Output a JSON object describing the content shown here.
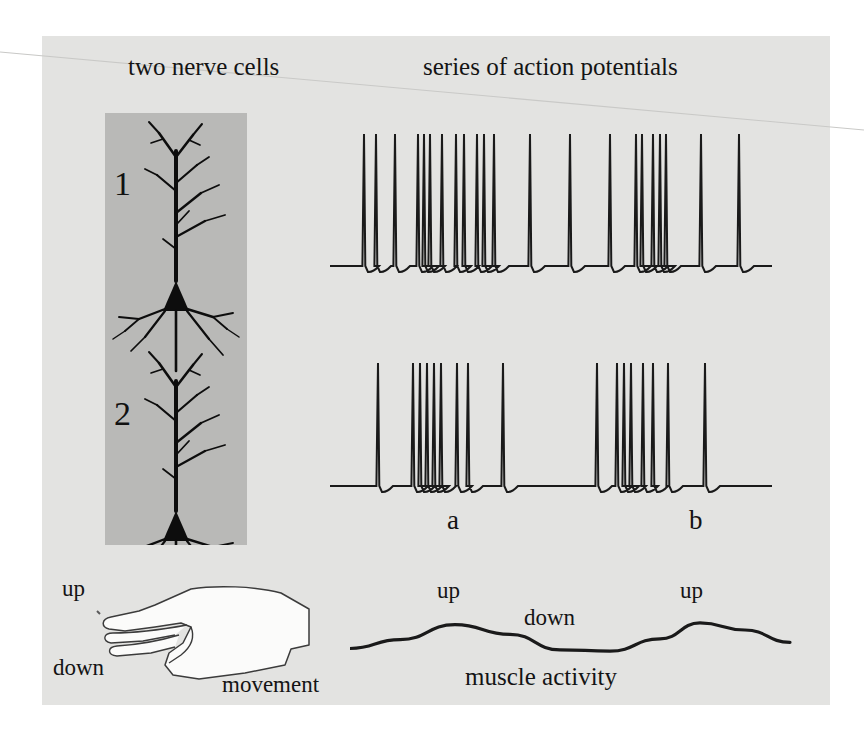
{
  "headings": {
    "left": "two nerve cells",
    "right": "series of action potentials"
  },
  "neurons": [
    {
      "number": "1",
      "name": "pyramidal-neuron-1"
    },
    {
      "number": "2",
      "name": "pyramidal-neuron-2"
    }
  ],
  "trace_labels": {
    "a": "a",
    "b": "b"
  },
  "hand": {
    "up": "up",
    "down": "down",
    "movement": "movement"
  },
  "muscle": {
    "up_first": "up",
    "down": "down",
    "up_second": "up",
    "caption": "muscle activity"
  },
  "colors": {
    "page_background": "#ffffff",
    "panel_background": "#e3e3e1",
    "neuron_box_background": "#b9b9b7",
    "ink": "#141414",
    "trace_stroke": "#1a1a1a",
    "hand_fill": "#fbfbfa",
    "hand_stroke": "#3b3b3b"
  },
  "chart_data": [
    {
      "type": "line",
      "name": "spike-train-neuron-1",
      "title": "series of action potentials",
      "ylabel": "membrane potential",
      "xlabel": "time",
      "baseline": 272,
      "spike_top": 140,
      "x_start": 340,
      "x_end": 782,
      "grid": false,
      "legend": null,
      "spike_times": [
        374,
        385,
        404,
        428,
        434,
        440,
        451,
        466,
        473,
        486,
        493,
        503,
        512,
        541,
        539,
        0,
        0,
        0,
        0,
        0
      ],
      "spikes": [
        374,
        385,
        404,
        428,
        434,
        440,
        451,
        466,
        473,
        486,
        493,
        503,
        512,
        539,
        540,
        0,
        0,
        0,
        0,
        0
      ],
      "values": [
        374,
        386,
        405,
        428,
        434,
        440,
        452,
        466,
        474,
        487,
        494,
        504,
        540,
        580,
        620,
        646,
        652,
        663,
        670,
        676,
        711,
        749
      ],
      "bursts": [
        {
          "label": "burst-1",
          "from": 374,
          "to": 540
        },
        {
          "label": "sparse-1",
          "from": 580,
          "to": 620
        },
        {
          "label": "burst-2",
          "from": 646,
          "to": 676
        },
        {
          "label": "sparse-2",
          "from": 711,
          "to": 749
        }
      ]
    },
    {
      "type": "line",
      "name": "spike-train-neuron-2",
      "title": "series of action potentials",
      "ylabel": "membrane potential",
      "xlabel": "time",
      "baseline": 488,
      "spike_top": 365,
      "x_start": 340,
      "x_end": 782,
      "grid": false,
      "legend": null,
      "values": [
        388,
        423,
        430,
        437,
        444,
        451,
        467,
        478,
        513,
        607,
        627,
        634,
        641,
        653,
        663,
        678,
        715
      ],
      "bursts": [
        {
          "label": "burst-a",
          "from": 388,
          "to": 513
        },
        {
          "label": "silence",
          "from": 513,
          "to": 607
        },
        {
          "label": "burst-b",
          "from": 607,
          "to": 715
        }
      ]
    },
    {
      "type": "line",
      "name": "muscle-activity-curve",
      "title": "muscle activity",
      "xlabel": "time",
      "ylabel": "muscle activity",
      "grid": false,
      "legend": null,
      "annotations": [
        {
          "text": "up",
          "x": 455,
          "y": 600
        },
        {
          "text": "down",
          "x": 560,
          "y": 628
        },
        {
          "text": "up",
          "x": 700,
          "y": 600
        }
      ],
      "x": [
        350,
        400,
        455,
        510,
        560,
        610,
        660,
        700,
        745,
        790
      ],
      "values": [
        0.08,
        0.28,
        0.62,
        0.4,
        0.05,
        0.02,
        0.3,
        0.66,
        0.5,
        0.22
      ]
    }
  ]
}
